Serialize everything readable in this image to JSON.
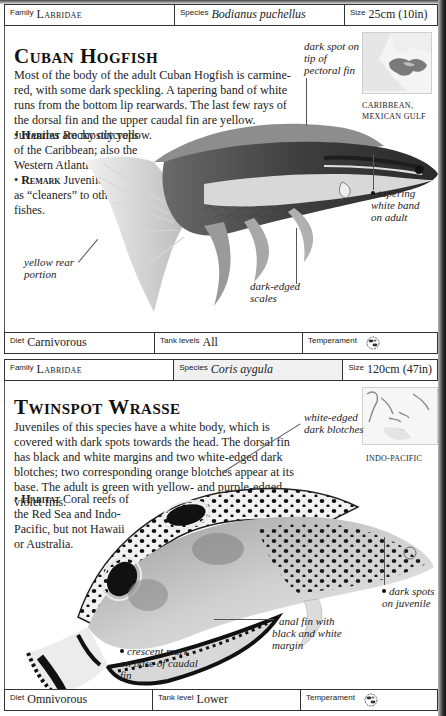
{
  "entries": [
    {
      "header": {
        "family_label": "Family",
        "family_value": "Labridae",
        "species_label": "Species",
        "species_value": "Bodianus puchellus",
        "size_label": "Size",
        "size_value": "25cm (10in)"
      },
      "title": "Cuban Hogfish",
      "description": "Most of the body of the adult Cuban Hogfish is carmine-red, with some dark speckling. A tapering band of white runs from the bottom lip rearwards. The last few rays of the dorsal fin and the upper caudal fin are yellow. Juveniles are mostly yellow.",
      "habitat_label": "Habitat",
      "habitat_text": "Rocky outcrops of the Caribbean; also the Western Atlantic.",
      "remark_label": "Remark",
      "remark_text": "Juveniles may act as “cleaners” to other fishes.",
      "map_caption_line1": "CARIBBEAN,",
      "map_caption_line2": "MEXICAN GULF",
      "annotations": {
        "pectoral": "dark spot on tip of pectoral fin",
        "band": "tapering white band on adult",
        "rear": "yellow rear portion",
        "scales": "dark-edged scales"
      },
      "footer": {
        "diet_label": "Diet",
        "diet_value": "Carnivorous",
        "tank_label": "Tank levels",
        "tank_value": "All",
        "temperament_label": "Temperament",
        "temperament_icon": "community-fish-icon"
      }
    },
    {
      "header": {
        "family_label": "Family",
        "family_value": "Labridae",
        "species_label": "Species",
        "species_value": "Coris aygula",
        "size_label": "Size",
        "size_value": "120cm (47in)"
      },
      "title": "Twinspot Wrasse",
      "description": "Juveniles of this species have a white body, which is covered with dark spots towards the head. The dorsal fin has black and white margins and two white-edged dark blotches; two corresponding orange blotches appear at its base. The adult is green with yellow- and purple-edged violet fins.",
      "habitat_label": "Habitat",
      "habitat_text": "Coral reefs of the Red Sea and Indo-Pacific, but not Hawaii or Australia.",
      "map_caption_line1": "INDO-PACIFIC",
      "annotations": {
        "blotches": "white-edged dark blotches",
        "spots": "dark spots on juvenile",
        "anal": "anal fin with black and white margin",
        "crescent": "crescent mark on base of caudal fin"
      },
      "footer": {
        "diet_label": "Diet",
        "diet_value": "Omnivorous",
        "tank_label": "Tank level",
        "tank_value": "Lower",
        "temperament_label": "Temperament",
        "temperament_icon": "community-fish-icon"
      }
    }
  ]
}
